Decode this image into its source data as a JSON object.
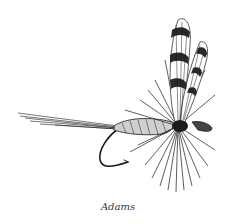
{
  "figure": {
    "caption": "Adams",
    "ink_color": "#1a1a1a",
    "background": "#ffffff"
  }
}
